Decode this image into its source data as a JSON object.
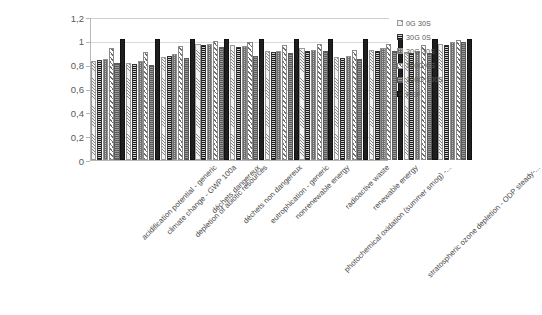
{
  "chart_data": {
    "type": "bar",
    "title": "",
    "subtitle": "",
    "xlabel": "",
    "ylabel": "",
    "ylim": [
      0,
      1.2
    ],
    "yticks": [
      "0",
      "0,2",
      "0,4",
      "0,6",
      "0,8",
      "1",
      "1,2"
    ],
    "ytick_values": [
      0,
      0.2,
      0.4,
      0.6,
      0.8,
      1,
      1.2
    ],
    "grid": true,
    "legend_position": "right",
    "decimal_separator": ",",
    "categories": [
      "acidification potential - generic",
      "climate change - GWP 100a",
      "depletion of abiotic resources",
      "déchets dangereux",
      "déchets non dangereux",
      "eutrophication - generic",
      "nonrenewable energy",
      "photochemical oxidation (summer smog) -...",
      "radioactive waste",
      "renewable energy",
      "stratospheric ozone depletion - ODP steady-..."
    ],
    "series": [
      {
        "name": "0G 30S",
        "color": "#f2f2f2",
        "values": [
          0.81,
          0.8,
          0.85,
          0.96,
          0.95,
          0.9,
          0.92,
          0.85,
          0.91,
          0.89,
          0.96
        ]
      },
      {
        "name": "30G 0S",
        "color": "#4d4d4d",
        "values": [
          0.82,
          0.79,
          0.86,
          0.95,
          0.93,
          0.89,
          0.9,
          0.84,
          0.9,
          0.88,
          0.95
        ]
      },
      {
        "name": "30G 30S",
        "color": "#bfbfbf",
        "values": [
          0.83,
          0.81,
          0.87,
          0.96,
          0.94,
          0.9,
          0.91,
          0.86,
          0.92,
          0.9,
          0.97
        ]
      },
      {
        "name": "100G 0S",
        "color": "#efefef",
        "values": [
          0.92,
          0.89,
          0.94,
          0.98,
          0.97,
          0.95,
          0.96,
          0.91,
          0.96,
          0.95,
          0.99
        ]
      },
      {
        "name": "100G 100S",
        "color": "#7f7f7f",
        "values": [
          0.8,
          0.78,
          0.84,
          0.93,
          0.86,
          0.88,
          0.9,
          0.83,
          0.9,
          0.88,
          0.97
        ]
      },
      {
        "name": "REF",
        "color": "#1f1f1f",
        "values": [
          1.0,
          1.0,
          1.0,
          1.0,
          1.0,
          1.0,
          1.0,
          1.0,
          1.0,
          1.0,
          1.0
        ]
      }
    ]
  },
  "legend": {
    "items": [
      {
        "label": "0G 30S"
      },
      {
        "label": "30G 0S"
      },
      {
        "label": "30G 30S"
      },
      {
        "label": "100G 0S"
      },
      {
        "label": "100G 100S"
      },
      {
        "label": "REF"
      }
    ]
  }
}
